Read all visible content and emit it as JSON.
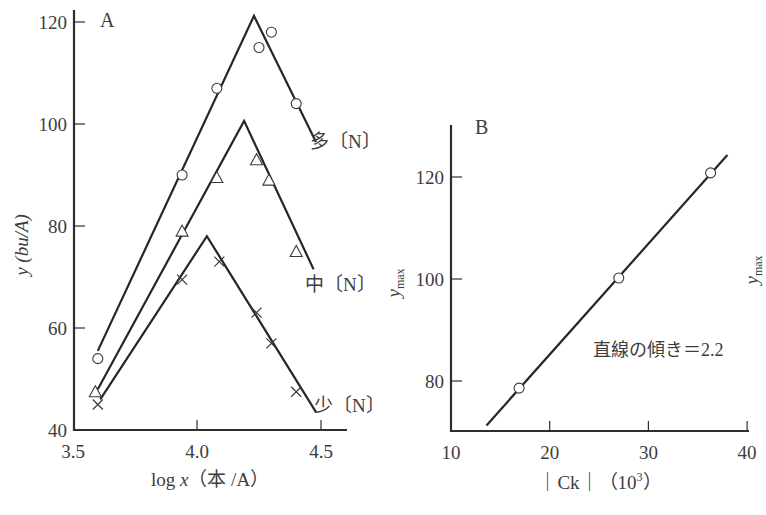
{
  "chart_data": [
    {
      "panel": "A",
      "type": "line",
      "xlabel": "log x（本／A）",
      "ylabel": "y (bu/A)",
      "xlim": [
        3.5,
        4.6
      ],
      "ylim": [
        40,
        121
      ],
      "xticks": [
        3.5,
        4.0,
        4.5
      ],
      "xtick_labels": [
        "3.5",
        "4.0",
        "4.5"
      ],
      "yticks": [
        40,
        60,
        80,
        100,
        120
      ],
      "ytick_labels": [
        "40",
        "60",
        "80",
        "100",
        "120"
      ],
      "grid": false,
      "series": [
        {
          "name": "多〔N〕",
          "marker": "circle",
          "points": [
            [
              3.6,
              54
            ],
            [
              3.94,
              90
            ],
            [
              4.08,
              107
            ],
            [
              4.25,
              115
            ],
            [
              4.3,
              118
            ],
            [
              4.4,
              104
            ]
          ],
          "fit_line": [
            [
              3.6,
              55.5
            ],
            [
              4.23,
              121.2
            ],
            [
              4.48,
              96.5
            ]
          ]
        },
        {
          "name": "中〔N〕",
          "marker": "triangle",
          "points": [
            [
              3.59,
              47.5
            ],
            [
              3.94,
              79
            ],
            [
              4.08,
              89.5
            ],
            [
              4.24,
              93
            ],
            [
              4.29,
              89
            ],
            [
              4.4,
              75
            ]
          ],
          "fit_line": [
            [
              3.6,
              48
            ],
            [
              4.19,
              100.6
            ],
            [
              4.47,
              71.5
            ]
          ]
        },
        {
          "name": "少〔N〕",
          "marker": "x",
          "points": [
            [
              3.6,
              45
            ],
            [
              3.94,
              69.5
            ],
            [
              4.09,
              73
            ],
            [
              4.24,
              63
            ],
            [
              4.3,
              57
            ],
            [
              4.4,
              47.5
            ]
          ],
          "fit_line": [
            [
              3.61,
              46
            ],
            [
              4.04,
              78
            ],
            [
              4.48,
              43.5
            ]
          ]
        }
      ]
    },
    {
      "panel": "B",
      "type": "scatter",
      "xlabel": "｜Ck｜（10³）",
      "ylabel": "y_max",
      "xlim": [
        10,
        40
      ],
      "ylim": [
        70.2,
        130
      ],
      "xticks": [
        10,
        20,
        30,
        40
      ],
      "xtick_labels": [
        "10",
        "20",
        "30",
        "40"
      ],
      "yticks": [
        80,
        100,
        120
      ],
      "ytick_labels": [
        "80",
        "100",
        "120"
      ],
      "grid": false,
      "series": [
        {
          "name": "y_max",
          "marker": "circle",
          "points": [
            [
              16.9,
              78.6
            ],
            [
              27.0,
              100.2
            ],
            [
              36.3,
              120.8
            ]
          ],
          "fit_line": [
            [
              13.6,
              71.3
            ],
            [
              38.0,
              124.3
            ]
          ]
        }
      ],
      "annotations": [
        {
          "text": "直線の傾き＝2.2",
          "x": 24.5,
          "y": 94
        }
      ],
      "slope": 2.2
    }
  ],
  "labels": {
    "panel_a": "A",
    "panel_b": "B",
    "a_ylabel": "y (bu/A)",
    "a_xlabel_log": "log ",
    "a_xlabel_var": "x",
    "a_xlabel_unit": "（本 /A）",
    "b_ylabel_main": "y",
    "b_ylabel_sub": "max",
    "b_xlabel": "｜Ck｜（10",
    "b_xlabel_sup": "3",
    "b_xlabel_end": "）",
    "slope_annotation": "直線の傾き＝2.2",
    "stray_label_main": "y",
    "stray_label_sub": "max"
  }
}
